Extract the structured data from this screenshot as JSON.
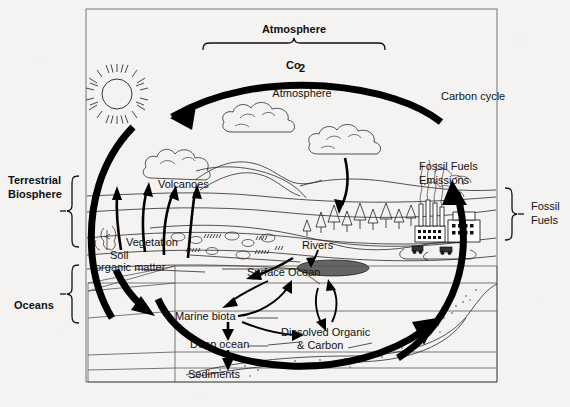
{
  "diagram": {
    "frame_color": "#555555",
    "background_color": "#f4f3f1",
    "ink_color": "#000000"
  },
  "labels": {
    "atmosphere_heading": "Atmosphere",
    "co2": "Co",
    "co2_sub": "2",
    "atmosphere_inner": "Atmosphere",
    "carbon_cycle": "Carbon cycle",
    "terrestrial_biosphere_line1": "Terrestrial",
    "terrestrial_biosphere_line2": "Biosphere",
    "oceans": "Oceans",
    "fossil_fuels_right_line1": "Fossil",
    "fossil_fuels_right_line2": "Fuels",
    "fossil_fuels_emissions_line1": "Fossil Fuels",
    "fossil_fuels_emissions_line2": "Emissions",
    "volcanoes": "Volcanoes",
    "vegetation": "Vegetation",
    "soil_line1": "Soil",
    "soil_line2": "organic matter",
    "rivers": "Rivers",
    "surface_ocean": "Surface Ocean",
    "marine_biota": "Marine biota",
    "deep_ocean": "Deep ocean",
    "dissolved_organic_line1": "Dissolved Organic",
    "dissolved_organic_line2": "& Carbon",
    "sediments": "Sediments"
  },
  "icons": {
    "sun": "sun-icon",
    "cloud_left": "cloud-icon",
    "cloud_right": "cloud-icon",
    "volcano_plume": "volcano-plume-icon",
    "factory": "factory-icon",
    "trees": "trees-icon",
    "crops": "crops-icon"
  }
}
